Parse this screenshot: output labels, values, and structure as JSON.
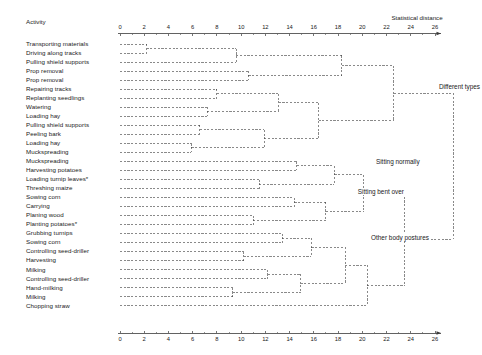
{
  "header": {
    "activity_label": "Activity"
  },
  "axis": {
    "title": "Statistical distance",
    "ticks": [
      0,
      2,
      4,
      6,
      8,
      10,
      12,
      14,
      16,
      18,
      20,
      22,
      24,
      26
    ],
    "min": 0,
    "max": 26,
    "pixel_min": 120,
    "pixel_max": 435
  },
  "activities": [
    {
      "index": 0,
      "label": "Transporting materials"
    },
    {
      "index": 1,
      "label": "Driving along tracks"
    },
    {
      "index": 2,
      "label": "Pulling shield supports"
    },
    {
      "index": 3,
      "label": "Prop removal"
    },
    {
      "index": 4,
      "label": "Prop removal"
    },
    {
      "index": 5,
      "label": "Repairing tracks"
    },
    {
      "index": 6,
      "label": "Replanting seedlings"
    },
    {
      "index": 7,
      "label": "Watering"
    },
    {
      "index": 8,
      "label": "Loading hay"
    },
    {
      "index": 9,
      "label": "Pulling shield supports"
    },
    {
      "index": 10,
      "label": "Peeling bark"
    },
    {
      "index": 11,
      "label": "Loading hay"
    },
    {
      "index": 12,
      "label": "Muckspreading"
    },
    {
      "index": 13,
      "label": "Muckspreading"
    },
    {
      "index": 14,
      "label": "Harvesting potatoes"
    },
    {
      "index": 15,
      "label": "Loading turnip leaves*"
    },
    {
      "index": 16,
      "label": "Threshing maize"
    },
    {
      "index": 17,
      "label": "Sowing corn"
    },
    {
      "index": 18,
      "label": "Carrying"
    },
    {
      "index": 19,
      "label": "Planing wood"
    },
    {
      "index": 20,
      "label": "Planting potatoes*"
    },
    {
      "index": 21,
      "label": "Grubbing turnips"
    },
    {
      "index": 22,
      "label": "Sowing corn"
    },
    {
      "index": 23,
      "label": "Controlling seed-driller"
    },
    {
      "index": 24,
      "label": "Harvesting"
    },
    {
      "index": 25,
      "label": "Milking"
    },
    {
      "index": 26,
      "label": "Controlling seed-driller"
    },
    {
      "index": 27,
      "label": "Hand-milking"
    },
    {
      "index": 28,
      "label": "Milking"
    },
    {
      "index": 29,
      "label": "Chopping straw"
    }
  ],
  "annotations": [
    {
      "name": "different-types",
      "text": "Different types",
      "x": 26.2,
      "row": 4.8
    },
    {
      "name": "sitting-normally",
      "text": "Sitting normally",
      "x": 21.0,
      "row": 13.1
    },
    {
      "name": "sitting-bent-over",
      "text": "Sitting bent over",
      "x": 19.5,
      "row": 16.5
    },
    {
      "name": "other-body-postures",
      "text": "Other body postures",
      "x": 20.6,
      "row": 21.6
    }
  ],
  "chart_data": {
    "type": "dendrogram",
    "title": "",
    "xlabel": "Statistical distance",
    "ylabel": "Activity",
    "xlim": [
      0,
      26
    ],
    "xticks": [
      0,
      2,
      4,
      6,
      8,
      10,
      12,
      14,
      16,
      18,
      20,
      22,
      24,
      26
    ],
    "grid": false,
    "legend": false,
    "leaves": [
      "Transporting materials",
      "Driving along tracks",
      "Pulling shield supports",
      "Prop removal",
      "Prop removal",
      "Repairing tracks",
      "Replanting seedlings",
      "Watering",
      "Loading hay",
      "Pulling shield supports",
      "Peeling bark",
      "Loading hay",
      "Muckspreading",
      "Muckspreading",
      "Harvesting potatoes",
      "Loading turnip leaves*",
      "Threshing maize",
      "Sowing corn",
      "Carrying",
      "Planing wood",
      "Planting potatoes*",
      "Grubbing turnips",
      "Sowing corn",
      "Controlling seed-driller",
      "Harvesting",
      "Milking",
      "Controlling seed-driller",
      "Hand-milking",
      "Milking",
      "Chopping straw"
    ],
    "merges": [
      {
        "id": "m1",
        "left": "leaf:0",
        "right": "leaf:1",
        "distance": 2.2
      },
      {
        "id": "m2",
        "left": "m1",
        "right": "leaf:2",
        "distance": 9.6
      },
      {
        "id": "m3",
        "left": "leaf:3",
        "right": "leaf:4",
        "distance": 10.6
      },
      {
        "id": "m4",
        "left": "m2",
        "right": "m3",
        "distance": 18.3
      },
      {
        "id": "m5",
        "left": "leaf:5",
        "right": "leaf:6",
        "distance": 8.0
      },
      {
        "id": "m6",
        "left": "leaf:7",
        "right": "leaf:8",
        "distance": 7.2
      },
      {
        "id": "m7",
        "left": "m5",
        "right": "m6",
        "distance": 13.1
      },
      {
        "id": "m8",
        "left": "leaf:9",
        "right": "leaf:10",
        "distance": 6.6
      },
      {
        "id": "m9",
        "left": "leaf:11",
        "right": "leaf:12",
        "distance": 5.9
      },
      {
        "id": "m10",
        "left": "m8",
        "right": "m9",
        "distance": 11.9
      },
      {
        "id": "m11",
        "left": "m7",
        "right": "m10",
        "distance": 16.4
      },
      {
        "id": "m12",
        "left": "m4",
        "right": "m11",
        "distance": 22.6
      },
      {
        "id": "m13",
        "left": "leaf:13",
        "right": "leaf:14",
        "distance": 14.6
      },
      {
        "id": "m14",
        "left": "leaf:15",
        "right": "leaf:16",
        "distance": 11.5
      },
      {
        "id": "m15",
        "left": "m13",
        "right": "m14",
        "distance": 17.7
      },
      {
        "id": "m16",
        "left": "leaf:17",
        "right": "leaf:18",
        "distance": 14.4
      },
      {
        "id": "m17",
        "left": "leaf:19",
        "right": "leaf:20",
        "distance": 11.0
      },
      {
        "id": "m18",
        "left": "m16",
        "right": "m17",
        "distance": 17.0
      },
      {
        "id": "m19",
        "left": "m15",
        "right": "m18",
        "distance": 20.1
      },
      {
        "id": "m20",
        "left": "leaf:21",
        "right": "leaf:22",
        "distance": 13.4
      },
      {
        "id": "m21",
        "left": "leaf:23",
        "right": "leaf:24",
        "distance": 10.2
      },
      {
        "id": "m22",
        "left": "m20",
        "right": "m21",
        "distance": 15.8
      },
      {
        "id": "m23",
        "left": "leaf:25",
        "right": "leaf:26",
        "distance": 12.2
      },
      {
        "id": "m24",
        "left": "leaf:27",
        "right": "leaf:28",
        "distance": 9.3
      },
      {
        "id": "m25",
        "left": "m23",
        "right": "m24",
        "distance": 14.9
      },
      {
        "id": "m26",
        "left": "m22",
        "right": "m25",
        "distance": 18.6
      },
      {
        "id": "m27",
        "left": "m26",
        "right": "leaf:29",
        "distance": 20.4
      },
      {
        "id": "m28",
        "left": "m19",
        "right": "m27",
        "distance": 23.5
      },
      {
        "id": "m29",
        "left": "m12",
        "right": "m28",
        "distance": 27.5
      }
    ]
  },
  "style": {
    "line_color": "#3b3b3b",
    "text_color": "#1a1a1a",
    "background": "#ffffff"
  }
}
